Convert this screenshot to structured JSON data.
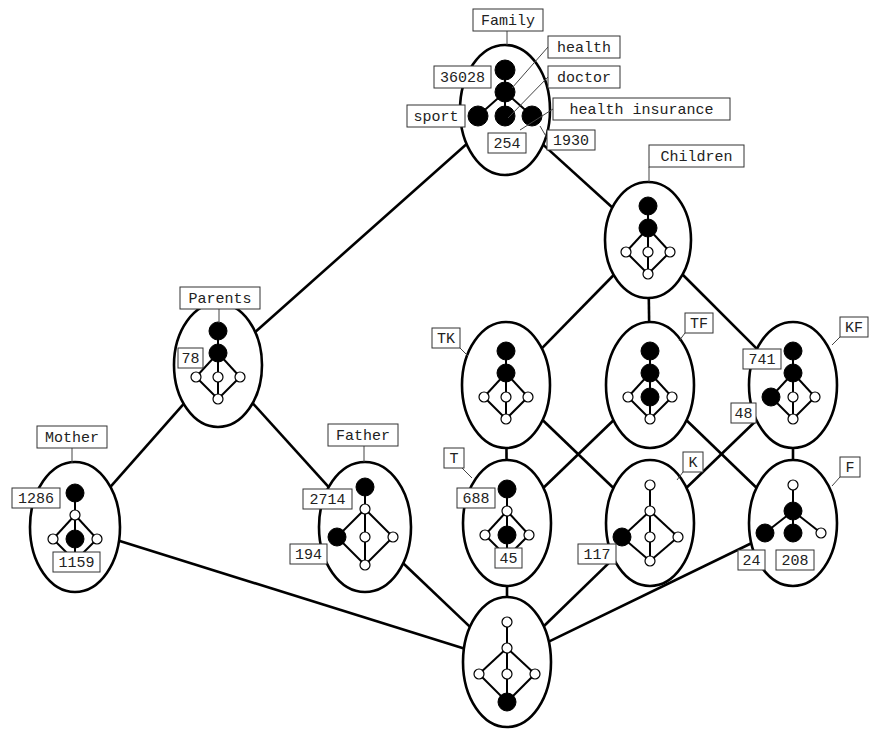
{
  "diagram": {
    "type": "concept-lattice-of-lattices",
    "nodes": [
      {
        "id": "family",
        "label": "Family",
        "cx": 505,
        "cy": 110,
        "rx": 45,
        "ry": 65,
        "label_box": {
          "x": 473,
          "y": 9,
          "w": 70,
          "h": 22
        },
        "leader": [
          [
            507,
            31
          ],
          [
            507,
            45
          ]
        ],
        "pattern": "family"
      },
      {
        "id": "children",
        "label": "Children",
        "cx": 648,
        "cy": 240,
        "rx": 43,
        "ry": 58,
        "label_box": {
          "x": 649,
          "y": 145,
          "w": 95,
          "h": 22
        },
        "leader": [
          [
            649,
            167
          ],
          [
            649,
            182
          ]
        ],
        "pattern": "children"
      },
      {
        "id": "parents",
        "label": "Parents",
        "cx": 218,
        "cy": 365,
        "rx": 44,
        "ry": 62,
        "label_box": {
          "x": 180,
          "y": 287,
          "w": 80,
          "h": 22
        },
        "leader": [
          [
            219,
            309
          ],
          [
            219,
            323
          ]
        ],
        "pattern": "children"
      },
      {
        "id": "tk",
        "label": "TK",
        "cx": 506,
        "cy": 385,
        "rx": 44,
        "ry": 63,
        "label_box": {
          "x": 432,
          "y": 328,
          "w": 28,
          "h": 20
        },
        "leader": [
          [
            460,
            348
          ],
          [
            468,
            356
          ]
        ],
        "pattern": "children"
      },
      {
        "id": "tf",
        "label": "TF",
        "cx": 650,
        "cy": 385,
        "rx": 44,
        "ry": 63,
        "label_box": {
          "x": 685,
          "y": 313,
          "w": 28,
          "h": 20
        },
        "leader": [
          [
            685,
            333
          ],
          [
            679,
            341
          ]
        ],
        "pattern": "tf"
      },
      {
        "id": "kf",
        "label": "KF",
        "cx": 793,
        "cy": 385,
        "rx": 44,
        "ry": 63,
        "label_box": {
          "x": 840,
          "y": 317,
          "w": 28,
          "h": 20
        },
        "leader": [
          [
            840,
            337
          ],
          [
            832,
            345
          ]
        ],
        "pattern": "kf"
      },
      {
        "id": "mother",
        "label": "Mother",
        "cx": 75,
        "cy": 527,
        "rx": 45,
        "ry": 65,
        "label_box": {
          "x": 37,
          "y": 426,
          "w": 70,
          "h": 22
        },
        "leader": [
          [
            72,
            448
          ],
          [
            72,
            463
          ]
        ],
        "pattern": "mother"
      },
      {
        "id": "father",
        "label": "Father",
        "cx": 365,
        "cy": 527,
        "rx": 46,
        "ry": 65,
        "label_box": {
          "x": 328,
          "y": 424,
          "w": 70,
          "h": 22
        },
        "leader": [
          [
            364,
            446
          ],
          [
            364,
            462
          ]
        ],
        "pattern": "father"
      },
      {
        "id": "t",
        "label": "T",
        "cx": 507,
        "cy": 523,
        "rx": 44,
        "ry": 63,
        "label_box": {
          "x": 444,
          "y": 448,
          "w": 20,
          "h": 20
        },
        "leader": [
          [
            462,
            468
          ],
          [
            472,
            478
          ]
        ],
        "pattern": "t"
      },
      {
        "id": "k",
        "label": "K",
        "cx": 650,
        "cy": 523,
        "rx": 44,
        "ry": 63,
        "label_box": {
          "x": 683,
          "y": 452,
          "w": 20,
          "h": 20
        },
        "leader": [
          [
            683,
            472
          ],
          [
            677,
            480
          ]
        ],
        "pattern": "k"
      },
      {
        "id": "f",
        "label": "F",
        "cx": 793,
        "cy": 523,
        "rx": 44,
        "ry": 63,
        "label_box": {
          "x": 840,
          "y": 457,
          "w": 20,
          "h": 20
        },
        "leader": [
          [
            840,
            477
          ],
          [
            832,
            486
          ]
        ],
        "pattern": "f"
      },
      {
        "id": "bottom",
        "label": "",
        "cx": 507,
        "cy": 662,
        "rx": 44,
        "ry": 65,
        "label_box": null,
        "leader": null,
        "pattern": "bottom"
      }
    ],
    "edges": [
      [
        "family",
        "parents"
      ],
      [
        "family",
        "children"
      ],
      [
        "children",
        "tk"
      ],
      [
        "children",
        "tf"
      ],
      [
        "children",
        "kf"
      ],
      [
        "parents",
        "mother"
      ],
      [
        "parents",
        "father"
      ],
      [
        "tk",
        "t"
      ],
      [
        "tk",
        "k"
      ],
      [
        "tf",
        "t"
      ],
      [
        "tf",
        "f"
      ],
      [
        "kf",
        "k"
      ],
      [
        "kf",
        "f"
      ],
      [
        "mother",
        "bottom"
      ],
      [
        "father",
        "bottom"
      ],
      [
        "t",
        "bottom"
      ],
      [
        "k",
        "bottom"
      ],
      [
        "f",
        "bottom"
      ]
    ],
    "annotations": [
      {
        "text": "health",
        "x": 548,
        "y": 36,
        "w": 72,
        "h": 22,
        "leader": [
          [
            548,
            47
          ],
          [
            512,
            88
          ]
        ]
      },
      {
        "text": "doctor",
        "x": 548,
        "y": 66,
        "w": 72,
        "h": 22,
        "leader": [
          [
            548,
            77
          ],
          [
            508,
            118
          ]
        ]
      },
      {
        "text": "health insurance",
        "x": 553,
        "y": 98,
        "w": 177,
        "h": 22,
        "leader": [
          [
            553,
            109
          ],
          [
            520,
            130
          ]
        ]
      },
      {
        "text": "36028",
        "x": 434,
        "y": 66,
        "w": 57,
        "h": 22,
        "leader": null
      },
      {
        "text": "sport",
        "x": 407,
        "y": 105,
        "w": 58,
        "h": 22,
        "leader": null
      },
      {
        "text": "254",
        "x": 488,
        "y": 133,
        "w": 38,
        "h": 20,
        "leader": null
      },
      {
        "text": "1930",
        "x": 547,
        "y": 130,
        "w": 48,
        "h": 20,
        "leader": [
          [
            547,
            138
          ],
          [
            540,
            126
          ]
        ]
      },
      {
        "text": "78",
        "x": 178,
        "y": 348,
        "w": 25,
        "h": 20,
        "leader": null
      },
      {
        "text": "741",
        "x": 743,
        "y": 349,
        "w": 38,
        "h": 20,
        "leader": null
      },
      {
        "text": "48",
        "x": 731,
        "y": 403,
        "w": 25,
        "h": 20,
        "leader": null
      },
      {
        "text": "1286",
        "x": 12,
        "y": 488,
        "w": 48,
        "h": 20,
        "leader": null
      },
      {
        "text": "1159",
        "x": 53,
        "y": 552,
        "w": 47,
        "h": 20,
        "leader": null
      },
      {
        "text": "2714",
        "x": 303,
        "y": 489,
        "w": 49,
        "h": 20,
        "leader": null
      },
      {
        "text": "194",
        "x": 290,
        "y": 544,
        "w": 37,
        "h": 20,
        "leader": null
      },
      {
        "text": "688",
        "x": 457,
        "y": 488,
        "w": 38,
        "h": 20,
        "leader": null
      },
      {
        "text": "45",
        "x": 495,
        "y": 548,
        "w": 27,
        "h": 20,
        "leader": null
      },
      {
        "text": "117",
        "x": 578,
        "y": 544,
        "w": 38,
        "h": 20,
        "leader": null
      },
      {
        "text": "24",
        "x": 738,
        "y": 550,
        "w": 27,
        "h": 20,
        "leader": null
      },
      {
        "text": "208",
        "x": 776,
        "y": 550,
        "w": 38,
        "h": 20,
        "leader": null
      }
    ]
  }
}
